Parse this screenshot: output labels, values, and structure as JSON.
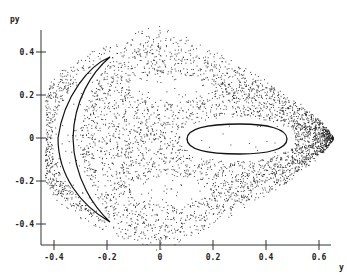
{
  "chart_data": {
    "type": "scatter",
    "title": "",
    "xlabel": "y",
    "ylabel": "py",
    "xlim": [
      -0.45,
      0.65
    ],
    "ylim": [
      -0.5,
      0.5
    ],
    "x_ticks": [
      -0.4,
      -0.2,
      0,
      0.2,
      0.4,
      0.6
    ],
    "x_tick_labels": [
      "-0.4",
      "-0.2",
      "0",
      "0.2",
      "0.4",
      "0.6"
    ],
    "y_ticks": [
      -0.4,
      -0.2,
      0,
      0.2,
      0.4
    ],
    "y_tick_labels": [
      "-0.4",
      "-0.2",
      "0",
      "0.2",
      "0.4"
    ],
    "grid": false,
    "legend": null,
    "series": [
      {
        "name": "chaotic-sea",
        "style": "dots",
        "envelope": {
          "y_min": -0.43,
          "y_max": 0.65,
          "py_max": 0.46,
          "py_min": -0.46
        },
        "approx_point_count": 4000
      },
      {
        "name": "crescent-orbit",
        "style": "closed-curve",
        "points": [
          [
            -0.19,
            0.37
          ],
          [
            -0.32,
            0.25
          ],
          [
            -0.39,
            0.0
          ],
          [
            -0.32,
            -0.25
          ],
          [
            -0.19,
            -0.36
          ],
          [
            -0.27,
            -0.22
          ],
          [
            -0.32,
            0.0
          ],
          [
            -0.27,
            0.22
          ]
        ]
      },
      {
        "name": "oval-orbit",
        "style": "closed-curve",
        "center": [
          0.3,
          0.0
        ],
        "y_range": [
          0.1,
          0.48
        ],
        "py_range": [
          -0.08,
          0.07
        ]
      }
    ]
  },
  "axes": {
    "x_name": "y",
    "y_name": "py"
  }
}
